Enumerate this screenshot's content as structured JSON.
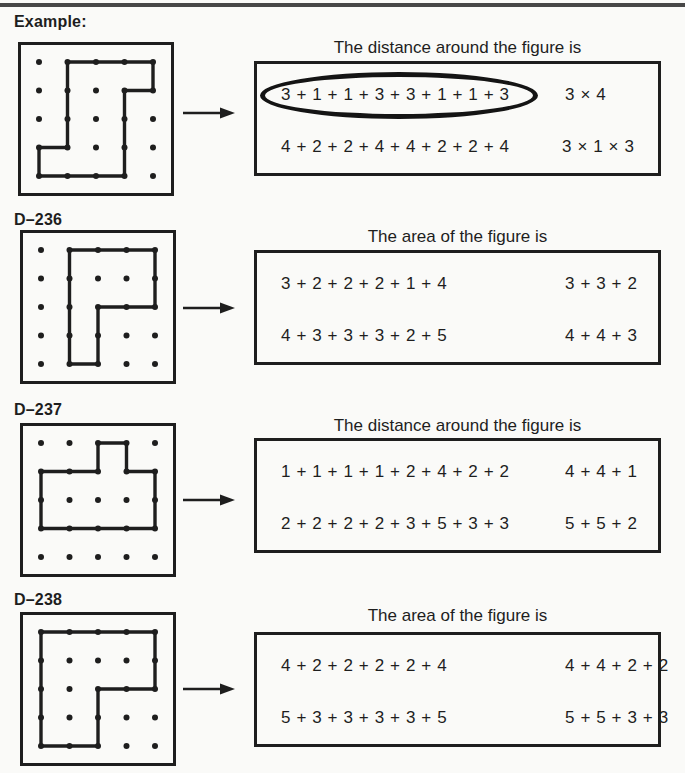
{
  "colors": {
    "ink": "#1e1e1e",
    "paper": "#fafaf8",
    "rule": "#474747"
  },
  "sections": [
    {
      "label": "Example:",
      "title": "The distance around the figure is",
      "options": [
        {
          "text": "3 + 1 + 1 + 3 + 3 + 1 + 1 + 3",
          "circled": true
        },
        {
          "text": "3 × 4",
          "circled": false
        },
        {
          "text": "4 + 2 + 2 + 4 + 4 + 2 + 2 + 4",
          "circled": false
        },
        {
          "text": "3 × 1 × 3",
          "circled": false
        }
      ],
      "figure": {
        "type": "geoboard",
        "rows": 5,
        "cols": 5,
        "polygon": [
          [
            1,
            0
          ],
          [
            4,
            0
          ],
          [
            4,
            1
          ],
          [
            3,
            1
          ],
          [
            3,
            4
          ],
          [
            0,
            4
          ],
          [
            0,
            3
          ],
          [
            1,
            3
          ]
        ]
      }
    },
    {
      "label": "D–236",
      "title": "The area of the figure is",
      "options": [
        {
          "text": "3 + 2 + 2 + 2 + 1 + 4",
          "circled": false
        },
        {
          "text": "3 + 3 + 2",
          "circled": false
        },
        {
          "text": "4 + 3 + 3 + 3 + 2 + 5",
          "circled": false
        },
        {
          "text": "4 + 4 + 3",
          "circled": false
        }
      ],
      "figure": {
        "type": "geoboard",
        "rows": 5,
        "cols": 5,
        "polygon": [
          [
            1,
            0
          ],
          [
            4,
            0
          ],
          [
            4,
            2
          ],
          [
            2,
            2
          ],
          [
            2,
            4
          ],
          [
            1,
            4
          ]
        ]
      }
    },
    {
      "label": "D–237",
      "title": "The distance around the figure is",
      "options": [
        {
          "text": "1 + 1 + 1 + 1 + 2 + 4 + 2 + 2",
          "circled": false
        },
        {
          "text": "4 + 4 + 1",
          "circled": false
        },
        {
          "text": "2 + 2 + 2 + 2 + 3 + 5 + 3 + 3",
          "circled": false
        },
        {
          "text": "5 + 5 + 2",
          "circled": false
        }
      ],
      "figure": {
        "type": "geoboard",
        "rows": 5,
        "cols": 5,
        "polygon": [
          [
            2,
            0
          ],
          [
            3,
            0
          ],
          [
            3,
            1
          ],
          [
            4,
            1
          ],
          [
            4,
            3
          ],
          [
            0,
            3
          ],
          [
            0,
            1
          ],
          [
            2,
            1
          ]
        ]
      }
    },
    {
      "label": "D–238",
      "title": "The area of the figure is",
      "options": [
        {
          "text": "4 + 2 + 2 + 2 + 2 + 4",
          "circled": false
        },
        {
          "text": "4 + 4 + 2 + 2",
          "circled": false
        },
        {
          "text": "5 + 3 + 3 + 3 + 3 + 5",
          "circled": false
        },
        {
          "text": "5 + 5 + 3 + 3",
          "circled": false
        }
      ],
      "figure": {
        "type": "geoboard",
        "rows": 5,
        "cols": 5,
        "polygon": [
          [
            0,
            0
          ],
          [
            4,
            0
          ],
          [
            4,
            2
          ],
          [
            2,
            2
          ],
          [
            2,
            4
          ],
          [
            0,
            4
          ]
        ]
      }
    }
  ]
}
